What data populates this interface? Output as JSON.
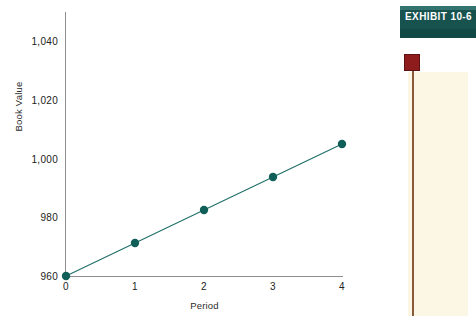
{
  "chart_data": {
    "type": "line",
    "title": "",
    "xlabel": "Period",
    "ylabel": "Book Value",
    "x": [
      0,
      1,
      2,
      3,
      4
    ],
    "values": [
      960,
      970,
      980,
      990,
      1000
    ],
    "series": [
      {
        "name": "Book Value",
        "values": [
          960,
          970,
          980,
          990,
          1000
        ]
      }
    ],
    "xtick_labels": [
      "0",
      "1",
      "2",
      "3",
      "4"
    ],
    "ytick_labels": [
      "960",
      "980",
      "1,000",
      "1,020",
      "1,040"
    ],
    "ytick_values": [
      960,
      980,
      1000,
      1020,
      1040
    ],
    "xlim": [
      0,
      4
    ],
    "ylim": [
      950,
      1040
    ],
    "grid": false,
    "legend": false,
    "marker": "circle",
    "line_color": "#1f6f68",
    "marker_color": "#0f5f58",
    "axis_color": "#8e8e8e"
  },
  "exhibit": {
    "label": "EXHIBIT  10-6",
    "banner_color": "#17524f",
    "flag_color": "#8e1c1c",
    "panel_color": "#fbf7e4"
  }
}
